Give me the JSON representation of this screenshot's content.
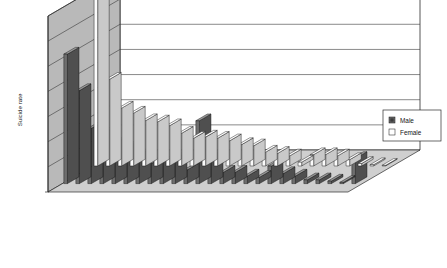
{
  "chart_data": {
    "type": "bar",
    "title": "",
    "subtitle": "",
    "xlabel": "",
    "ylabel": "Suicide rate",
    "ylim": [
      0,
      14
    ],
    "yticks": [
      0,
      2,
      4,
      6,
      8,
      10,
      12,
      14
    ],
    "grid": true,
    "legend_position": "right",
    "series_axis_labels": [
      "Female",
      "Male"
    ],
    "categories": [
      "West Bengal",
      "Tripura",
      "Karnataka",
      "Goa",
      "Pondicherry",
      "Maharashtra",
      "Orissa",
      "Andhra Pradesh",
      "Kerala",
      "Gujarat",
      "Arunachal Pradesh",
      "Assam",
      "Madhya Pradesh",
      "Tamil Nadu",
      "Himachal Pradesh",
      "Haryana",
      "Meghalaya",
      "Nagaland",
      "Rajasthan",
      "Uttar Pradesh",
      "Bihar",
      "Punjab",
      "Manipur",
      "Mizoram",
      "Sikkim"
    ],
    "series": [
      {
        "name": "Male",
        "color": "#6e6e6e",
        "values": [
          10.3,
          7.4,
          4.4,
          4.0,
          3.2,
          2.9,
          2.3,
          1.6,
          1.7,
          2.0,
          1.1,
          5.0,
          2.2,
          0.9,
          0.9,
          0.6,
          0.5,
          1.4,
          0.8,
          0.6,
          0.3,
          0.3,
          0.2,
          0.1,
          2.0
        ]
      },
      {
        "name": "Female",
        "color": "#ffffff",
        "values": [
          14.0,
          6.9,
          4.6,
          4.2,
          3.6,
          3.5,
          3.2,
          2.6,
          2.2,
          2.3,
          2.2,
          2.0,
          1.7,
          1.6,
          1.1,
          1.0,
          0.8,
          0.3,
          0.9,
          0.9,
          0.8,
          0.5,
          0.2,
          0.1,
          0.05
        ]
      }
    ]
  },
  "legend": {
    "items": [
      {
        "label": "Male",
        "swatch": "male-swatch"
      },
      {
        "label": "Female",
        "swatch": "female-swatch"
      }
    ]
  },
  "axis": {
    "y_title": "Suicide rate",
    "tick_labels": [
      "0",
      "2",
      "4",
      "6",
      "8",
      "10",
      "12",
      "14"
    ],
    "series_labels": [
      "Female",
      "Male"
    ]
  }
}
